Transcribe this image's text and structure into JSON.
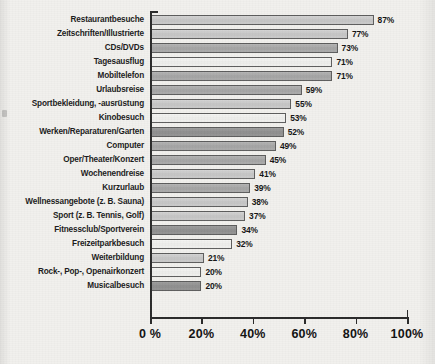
{
  "chart_data": {
    "type": "bar",
    "orientation": "horizontal",
    "title": "",
    "xlabel": "",
    "ylabel": "",
    "xlim": [
      0,
      100
    ],
    "grid": false,
    "legend": null,
    "xtick_labels": [
      "0 %",
      "20%",
      "40%",
      "60%",
      "80%",
      "100%"
    ],
    "xticks": [
      0,
      20,
      40,
      60,
      80,
      100
    ],
    "categories": [
      "Restaurantbesuche",
      "Zeitschriften/Illustrierte",
      "CDs/DVDs",
      "Tagesausflug",
      "Mobiltelefon",
      "Urlaubsreise",
      "Sportbekleidung, -ausrüstung",
      "Kinobesuch",
      "Werken/Reparaturen/Garten",
      "Computer",
      "Oper/Theater/Konzert",
      "Wochenendreise",
      "Kurzurlaub",
      "Wellnessangebote (z. B. Sauna)",
      "Sport (z. B. Tennis, Golf)",
      "Fitnessclub/Sportverein",
      "Freizeitparkbesuch",
      "Weiterbildung",
      "Rock-, Pop-, Openairkonzert",
      "Musicalbesuch"
    ],
    "values": [
      87,
      77,
      73,
      71,
      71,
      59,
      55,
      53,
      52,
      49,
      45,
      41,
      39,
      38,
      37,
      34,
      32,
      21,
      20,
      20
    ],
    "value_labels": [
      "87%",
      "77%",
      "73%",
      "71%",
      "71%",
      "59%",
      "55%",
      "53%",
      "52%",
      "49%",
      "45%",
      "41%",
      "39%",
      "38%",
      "37%",
      "34%",
      "32%",
      "21%",
      "20%",
      "20%"
    ],
    "bar_shades": [
      "shade-b",
      "shade-b",
      "shade-a",
      "shade-c",
      "shade-a",
      "shade-a",
      "shade-b",
      "shade-c",
      "shade-d",
      "shade-a",
      "shade-a",
      "shade-b",
      "shade-a",
      "shade-b",
      "shade-b",
      "shade-d",
      "shade-c",
      "shade-b",
      "shade-c",
      "shade-d"
    ],
    "colors": {
      "shade_a": "#a8a8a8",
      "shade_b": "#c8c8c8",
      "shade_c": "#f0f0ee",
      "shade_d": "#969696",
      "axis": "#2a2a2a",
      "background": "#f1f0ed",
      "text": "#1b1b1b"
    }
  }
}
